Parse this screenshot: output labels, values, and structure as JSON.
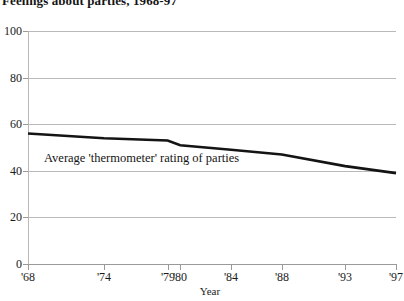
{
  "chart_data": {
    "type": "line",
    "title": "Feelings about parties, 1968-97",
    "xlabel": "Year",
    "ylabel": "",
    "xlim": [
      1968,
      1997
    ],
    "ylim": [
      0,
      100
    ],
    "grid": true,
    "legend_position": "none",
    "x_tick_labels": [
      "'68",
      "'74",
      "'79",
      "'80",
      "'84",
      "'88",
      "'93",
      "'97"
    ],
    "x_tick_values": [
      1968,
      1974,
      1979,
      1980,
      1984,
      1988,
      1993,
      1997
    ],
    "y_tick_labels": [
      "0",
      "20",
      "40",
      "60",
      "80",
      "100"
    ],
    "y_tick_values": [
      0,
      20,
      40,
      60,
      80,
      100
    ],
    "series": [
      {
        "name": "Average 'thermometer' rating of parties",
        "color": "#141414",
        "x": [
          1968,
          1974,
          1979,
          1980,
          1984,
          1988,
          1993,
          1997
        ],
        "values": [
          56,
          54,
          53,
          51,
          49,
          47,
          42,
          39
        ]
      }
    ],
    "annotations": [
      {
        "text": "Average 'thermometer' rating of parties",
        "x": 1969.3,
        "y": 45
      }
    ]
  },
  "axes": {
    "x_axis_label": "Year"
  }
}
